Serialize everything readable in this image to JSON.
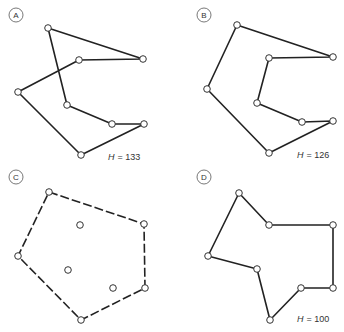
{
  "panels": [
    {
      "id": "A",
      "label": "A",
      "h_label": "H",
      "h_value": "= 133",
      "style": "solid",
      "path": [
        [
          48,
          28
        ],
        [
          143,
          59
        ],
        [
          79,
          60
        ],
        [
          18,
          92
        ],
        [
          81,
          155
        ],
        [
          144,
          124
        ],
        [
          112,
          124
        ],
        [
          67,
          105
        ],
        [
          48,
          28
        ]
      ],
      "points": [
        [
          48,
          28
        ],
        [
          143,
          59
        ],
        [
          79,
          60
        ],
        [
          18,
          92
        ],
        [
          67,
          105
        ],
        [
          112,
          124
        ],
        [
          144,
          124
        ],
        [
          81,
          155
        ]
      ]
    },
    {
      "id": "B",
      "label": "B",
      "h_label": "H",
      "h_value": "= 126",
      "style": "solid",
      "path": [
        [
          237,
          25
        ],
        [
          333,
          57
        ],
        [
          269,
          58
        ],
        [
          257,
          103
        ],
        [
          302,
          122
        ],
        [
          333,
          121
        ],
        [
          269,
          153
        ],
        [
          207,
          89
        ],
        [
          237,
          25
        ]
      ],
      "points": [
        [
          237,
          25
        ],
        [
          333,
          57
        ],
        [
          269,
          58
        ],
        [
          207,
          89
        ],
        [
          257,
          103
        ],
        [
          302,
          122
        ],
        [
          333,
          121
        ],
        [
          269,
          153
        ]
      ]
    },
    {
      "id": "C",
      "label": "C",
      "h_label": "",
      "h_value": "",
      "style": "dashed",
      "path": [
        [
          49,
          192
        ],
        [
          144,
          224
        ],
        [
          145,
          288
        ],
        [
          81,
          320
        ],
        [
          18,
          256
        ],
        [
          49,
          192
        ]
      ],
      "points": [
        [
          49,
          192
        ],
        [
          144,
          224
        ],
        [
          145,
          288
        ],
        [
          81,
          320
        ],
        [
          18,
          256
        ],
        [
          80,
          225
        ],
        [
          68,
          270
        ],
        [
          113,
          288
        ]
      ]
    },
    {
      "id": "D",
      "label": "D",
      "h_label": "H",
      "h_value": "= 100",
      "style": "solid",
      "path": [
        [
          239,
          193
        ],
        [
          269,
          225
        ],
        [
          333,
          225
        ],
        [
          333,
          288
        ],
        [
          301,
          288
        ],
        [
          270,
          320
        ],
        [
          257,
          269
        ],
        [
          208,
          256
        ],
        [
          239,
          193
        ]
      ],
      "points": [
        [
          239,
          193
        ],
        [
          269,
          225
        ],
        [
          333,
          225
        ],
        [
          333,
          288
        ],
        [
          301,
          288
        ],
        [
          270,
          320
        ],
        [
          257,
          269
        ],
        [
          208,
          256
        ]
      ]
    }
  ],
  "badges": {
    "A": {
      "x": 16,
      "y": 15
    },
    "B": {
      "x": 204,
      "y": 15
    },
    "C": {
      "x": 16,
      "y": 177
    },
    "D": {
      "x": 204,
      "y": 177
    }
  },
  "h_positions": {
    "A": {
      "x": 108,
      "y": 160
    },
    "B": {
      "x": 297,
      "y": 158
    },
    "D": {
      "x": 297,
      "y": 322
    }
  },
  "colors": {
    "line": "#222222",
    "node_fill": "#ffffff",
    "background": "#ffffff"
  }
}
